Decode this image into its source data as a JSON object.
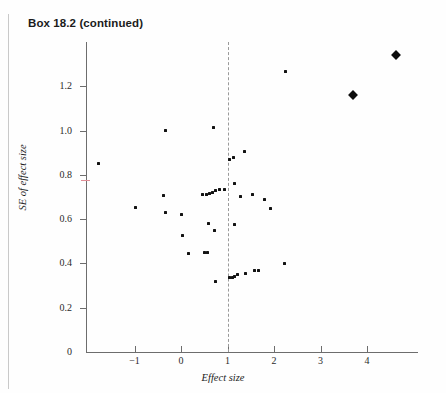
{
  "page": {
    "box_label": "Box 18.2 (continued)"
  },
  "chart_data": {
    "type": "scatter",
    "title": "",
    "xlabel": "Effect size",
    "ylabel": "SE of effect size",
    "xlim": [
      -1.8,
      5.1
    ],
    "ylim": [
      0,
      1.4
    ],
    "xticks": [
      -1,
      0,
      1,
      2,
      3,
      4
    ],
    "xticklabels": [
      "−1",
      "0",
      "1",
      "2",
      "3",
      "4"
    ],
    "yticks": [
      0,
      0.2,
      0.4,
      0.6,
      0.8,
      1.0,
      1.2
    ],
    "yticklabels": [
      "0",
      "0.2",
      "0.4",
      "0.6",
      "0.8",
      "1.0",
      "1.2"
    ],
    "grid": false,
    "legend": false,
    "annotations": [
      {
        "type": "vline",
        "x": 1,
        "style": "dashed",
        "color": "#9a9a9a"
      }
    ],
    "marker_color": "#131313",
    "series": [
      {
        "name": "studies",
        "marker": "small-square",
        "points": [
          {
            "x": -1.78,
            "y": 0.852
          },
          {
            "x": -0.97,
            "y": 0.654
          },
          {
            "x": -0.34,
            "y": 1.001
          },
          {
            "x": -0.37,
            "y": 0.707
          },
          {
            "x": -0.33,
            "y": 0.629
          },
          {
            "x": 0.01,
            "y": 0.622
          },
          {
            "x": 0.03,
            "y": 0.527
          },
          {
            "x": 0.17,
            "y": 0.445
          },
          {
            "x": 0.47,
            "y": 0.71
          },
          {
            "x": 0.54,
            "y": 0.712
          },
          {
            "x": 0.61,
            "y": 0.717
          },
          {
            "x": 0.68,
            "y": 0.722
          },
          {
            "x": 0.75,
            "y": 0.73
          },
          {
            "x": 0.83,
            "y": 0.733
          },
          {
            "x": 0.93,
            "y": 0.735
          },
          {
            "x": 0.5,
            "y": 0.447
          },
          {
            "x": 0.56,
            "y": 0.447
          },
          {
            "x": 0.59,
            "y": 0.581
          },
          {
            "x": 0.7,
            "y": 1.013
          },
          {
            "x": 0.73,
            "y": 0.547
          },
          {
            "x": 0.75,
            "y": 0.32
          },
          {
            "x": 1.04,
            "y": 0.871
          },
          {
            "x": 1.13,
            "y": 0.88
          },
          {
            "x": 1.36,
            "y": 0.906
          },
          {
            "x": 1.16,
            "y": 0.762
          },
          {
            "x": 1.28,
            "y": 0.7
          },
          {
            "x": 1.53,
            "y": 0.713
          },
          {
            "x": 1.8,
            "y": 0.688
          },
          {
            "x": 1.92,
            "y": 0.647
          },
          {
            "x": 1.16,
            "y": 0.576
          },
          {
            "x": 1.05,
            "y": 0.337
          },
          {
            "x": 1.11,
            "y": 0.338
          },
          {
            "x": 1.16,
            "y": 0.343
          },
          {
            "x": 1.21,
            "y": 0.348
          },
          {
            "x": 1.38,
            "y": 0.355
          },
          {
            "x": 1.57,
            "y": 0.367
          },
          {
            "x": 1.66,
            "y": 0.369
          },
          {
            "x": 2.22,
            "y": 0.398
          },
          {
            "x": 2.25,
            "y": 1.268
          }
        ]
      },
      {
        "name": "large-studies",
        "marker": "diamond",
        "points": [
          {
            "x": 3.7,
            "y": 1.16
          },
          {
            "x": 4.62,
            "y": 1.34
          }
        ]
      }
    ]
  }
}
